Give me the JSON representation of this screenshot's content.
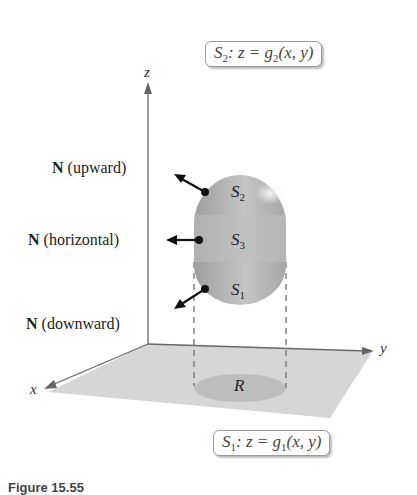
{
  "figure": {
    "top_equation": {
      "surface": "S",
      "surface_sub": "2",
      "rhs_prefix": ": z = g",
      "func_sub": "2",
      "args": "(x, y)"
    },
    "bottom_equation": {
      "surface": "S",
      "surface_sub": "1",
      "rhs_prefix": ": z = g",
      "func_sub": "1",
      "args": "(x, y)"
    },
    "normals": [
      {
        "bold": "N",
        "text": " (upward)"
      },
      {
        "bold": "N",
        "text": " (horizontal)"
      },
      {
        "bold": "N",
        "text": " (downward)"
      }
    ],
    "surfaces": [
      {
        "name": "S",
        "sub": "2"
      },
      {
        "name": "S",
        "sub": "3"
      },
      {
        "name": "S",
        "sub": "1"
      }
    ],
    "axes": {
      "x": "x",
      "y": "y",
      "z": "z"
    },
    "region": "R",
    "caption": "Figure 15.55"
  }
}
